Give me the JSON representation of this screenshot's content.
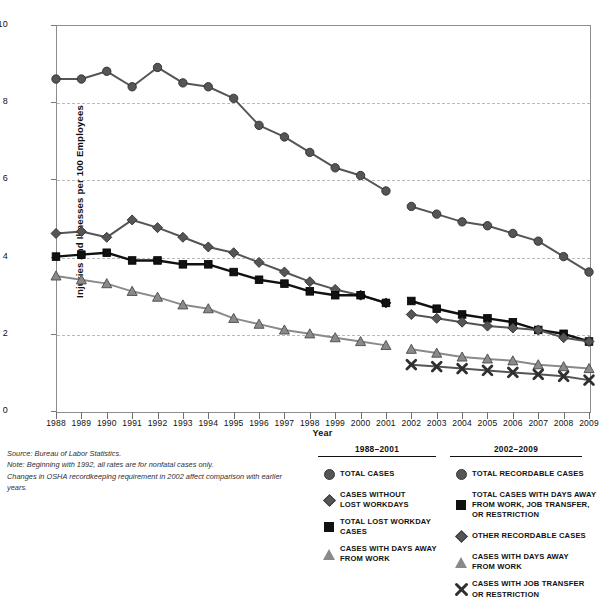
{
  "chart_data": {
    "type": "line",
    "title": "",
    "xlabel": "Year",
    "ylabel": "Injuries and Illnesses per 100 Employees",
    "xlim": [
      1988,
      2009
    ],
    "ylim": [
      0,
      10
    ],
    "yticks": [
      0,
      2,
      4,
      6,
      8,
      10
    ],
    "grid": "horizontal-dashed",
    "legend_position": "below-right",
    "categories": [
      1988,
      1989,
      1990,
      1991,
      1992,
      1993,
      1994,
      1995,
      1996,
      1997,
      1998,
      1999,
      2000,
      2001,
      2002,
      2003,
      2004,
      2005,
      2006,
      2007,
      2008,
      2009
    ],
    "series": [
      {
        "name": "TOTAL CASES",
        "period": "1988-2001",
        "marker": "circle",
        "color": "#555555",
        "x": [
          1988,
          1989,
          1990,
          1991,
          1992,
          1993,
          1994,
          1995,
          1996,
          1997,
          1998,
          1999,
          2000,
          2001
        ],
        "values": [
          8.6,
          8.6,
          8.8,
          8.4,
          8.9,
          8.5,
          8.4,
          8.1,
          7.4,
          7.1,
          6.7,
          6.3,
          6.1,
          5.7
        ]
      },
      {
        "name": "CASES WITHOUT LOST WORKDAYS",
        "period": "1988-2001",
        "marker": "diamond",
        "color": "#555555",
        "x": [
          1988,
          1989,
          1990,
          1991,
          1992,
          1993,
          1994,
          1995,
          1996,
          1997,
          1998,
          1999,
          2000,
          2001
        ],
        "values": [
          4.6,
          4.65,
          4.5,
          4.95,
          4.75,
          4.5,
          4.25,
          4.1,
          3.85,
          3.6,
          3.35,
          3.15,
          3.0,
          2.8
        ]
      },
      {
        "name": "TOTAL LOST WORKDAY CASES",
        "period": "1988-2001",
        "marker": "square",
        "color": "#111111",
        "x": [
          1988,
          1989,
          1990,
          1991,
          1992,
          1993,
          1994,
          1995,
          1996,
          1997,
          1998,
          1999,
          2000,
          2001
        ],
        "values": [
          4.0,
          4.05,
          4.1,
          3.9,
          3.9,
          3.8,
          3.8,
          3.6,
          3.4,
          3.3,
          3.1,
          3.0,
          3.0,
          2.8
        ]
      },
      {
        "name": "CASES WITH DAYS AWAY FROM WORK",
        "period": "1988-2001",
        "marker": "triangle",
        "color": "#8a8a8a",
        "x": [
          1988,
          1989,
          1990,
          1991,
          1992,
          1993,
          1994,
          1995,
          1996,
          1997,
          1998,
          1999,
          2000,
          2001
        ],
        "values": [
          3.5,
          3.4,
          3.3,
          3.1,
          2.95,
          2.75,
          2.65,
          2.4,
          2.25,
          2.1,
          2.0,
          1.9,
          1.8,
          1.7
        ]
      },
      {
        "name": "TOTAL RECORDABLE CASES",
        "period": "2002-2009",
        "marker": "circle",
        "color": "#555555",
        "x": [
          2002,
          2003,
          2004,
          2005,
          2006,
          2007,
          2008,
          2009
        ],
        "values": [
          5.3,
          5.1,
          4.9,
          4.8,
          4.6,
          4.4,
          4.0,
          3.6
        ]
      },
      {
        "name": "TOTAL CASES WITH DAYS AWAY FROM WORK, JOB TRANSFER, OR RESTRICTION",
        "period": "2002-2009",
        "marker": "square",
        "color": "#111111",
        "x": [
          2002,
          2003,
          2004,
          2005,
          2006,
          2007,
          2008,
          2009
        ],
        "values": [
          2.85,
          2.65,
          2.5,
          2.4,
          2.3,
          2.1,
          2.0,
          1.8
        ]
      },
      {
        "name": "OTHER RECORDABLE CASES",
        "period": "2002-2009",
        "marker": "diamond",
        "color": "#555555",
        "x": [
          2002,
          2003,
          2004,
          2005,
          2006,
          2007,
          2008,
          2009
        ],
        "values": [
          2.5,
          2.4,
          2.3,
          2.2,
          2.15,
          2.1,
          1.9,
          1.8
        ]
      },
      {
        "name": "CASES WITH DAYS AWAY FROM WORK",
        "period": "2002-2009",
        "marker": "triangle",
        "color": "#8a8a8a",
        "x": [
          2002,
          2003,
          2004,
          2005,
          2006,
          2007,
          2008,
          2009
        ],
        "values": [
          1.6,
          1.5,
          1.4,
          1.35,
          1.3,
          1.2,
          1.15,
          1.1
        ]
      },
      {
        "name": "CASES WITH JOB TRANSFER OR RESTRICTION",
        "period": "2002-2009",
        "marker": "x",
        "color": "#555555",
        "x": [
          2002,
          2003,
          2004,
          2005,
          2006,
          2007,
          2008,
          2009
        ],
        "values": [
          1.2,
          1.15,
          1.1,
          1.05,
          1.0,
          0.95,
          0.9,
          0.8
        ]
      }
    ]
  },
  "axis": {
    "y_title": "Injuries and Illnesses per 100 Employees",
    "x_title": "Year",
    "y_tick_labels": [
      "10",
      "8",
      "6",
      "4",
      "2",
      "0"
    ],
    "x_tick_labels": [
      "1988",
      "1989",
      "1990",
      "1991",
      "1992",
      "1993",
      "1994",
      "1995",
      "1996",
      "1997",
      "1998",
      "1999",
      "2000",
      "2001",
      "2002",
      "2003",
      "2004",
      "2005",
      "2006",
      "2007",
      "2008",
      "2009"
    ]
  },
  "footnotes": {
    "source": "Source: Bureau of Labor Statistics.",
    "note": "Note: Beginning with 1992, all rates are for nonfatal cases only.",
    "changes": "Changes in OSHA recordkeeping requirement in 2002 affect comparison with earlier years."
  },
  "legend_left": {
    "title": "1988–2001",
    "items": [
      {
        "marker": "circle",
        "label": "TOTAL CASES"
      },
      {
        "marker": "diamond",
        "label": "CASES WITHOUT\nLOST WORKDAYS"
      },
      {
        "marker": "square",
        "label": "TOTAL LOST WORKDAY\nCASES"
      },
      {
        "marker": "triangle",
        "label": "CASES WITH DAYS AWAY\nFROM WORK"
      }
    ]
  },
  "legend_right": {
    "title": "2002–2009",
    "items": [
      {
        "marker": "circle",
        "label": "TOTAL RECORDABLE CASES"
      },
      {
        "marker": "square",
        "label": "TOTAL CASES WITH DAYS AWAY\nFROM WORK,  JOB TRANSFER,\nOR RESTRICTION"
      },
      {
        "marker": "diamond",
        "label": "OTHER RECORDABLE CASES"
      },
      {
        "marker": "triangle",
        "label": "CASES WITH DAYS AWAY\nFROM WORK"
      },
      {
        "marker": "x",
        "label": "CASES WITH  JOB TRANSFER\nOR RESTRICTION"
      }
    ]
  },
  "colors": {
    "circle": "#555555",
    "square": "#111111",
    "diamond": "#555555",
    "triangle": "#8a8a8a",
    "x": "#555555",
    "grid": "#b9b9b9",
    "frame": "#8d8d8d"
  }
}
